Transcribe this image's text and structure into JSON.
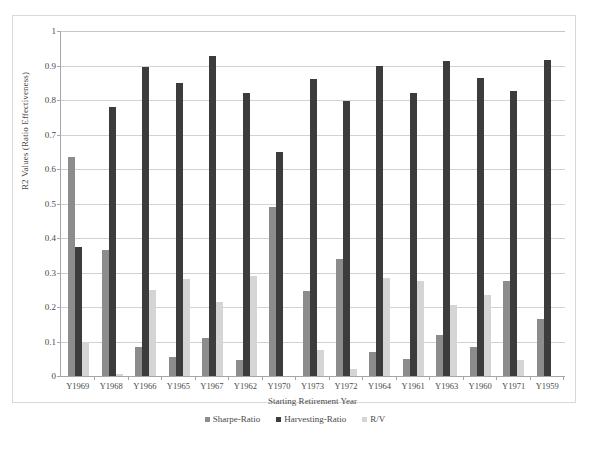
{
  "chart_data": {
    "type": "bar",
    "title": "",
    "xlabel": "Starting Retirement Year",
    "ylabel": "R2 Values (Ratio Effectiveness)",
    "ylim": [
      0,
      1
    ],
    "yticks": [
      "0",
      "0.1",
      "0.2",
      "0.3",
      "0.4",
      "0.5",
      "0.6",
      "0.7",
      "0.8",
      "0.9",
      "1"
    ],
    "grid": true,
    "legend_position": "bottom",
    "categories": [
      "Y1969",
      "Y1968",
      "Y1966",
      "Y1965",
      "Y1967",
      "Y1962",
      "Y1970",
      "Y1973",
      "Y1972",
      "Y1964",
      "Y1961",
      "Y1963",
      "Y1960",
      "Y1971",
      "Y1959"
    ],
    "series": [
      {
        "name": "Sharpe-Ratio",
        "color": "#8c8c8c",
        "values": [
          0.635,
          0.365,
          0.085,
          0.055,
          0.11,
          0.045,
          0.49,
          0.245,
          0.34,
          0.07,
          0.05,
          0.12,
          0.085,
          0.275,
          0.165
        ]
      },
      {
        "name": "Harvesting-Ratio",
        "color": "#3c3c3c",
        "values": [
          0.375,
          0.78,
          0.897,
          0.85,
          0.928,
          0.82,
          0.65,
          0.862,
          0.797,
          0.9,
          0.82,
          0.912,
          0.865,
          0.825,
          0.915
        ]
      },
      {
        "name": "R/V",
        "color": "#d5d5d5",
        "values": [
          0.1,
          0.005,
          0.25,
          0.28,
          0.215,
          0.29,
          0.0,
          0.075,
          0.02,
          0.285,
          0.275,
          0.205,
          0.235,
          0.045,
          0.0
        ]
      }
    ]
  },
  "legend": {
    "items": [
      {
        "label": "Sharpe-Ratio",
        "color": "#8c8c8c"
      },
      {
        "label": "Harvesting-Ratio",
        "color": "#3c3c3c"
      },
      {
        "label": "R/V",
        "color": "#d5d5d5"
      }
    ]
  }
}
